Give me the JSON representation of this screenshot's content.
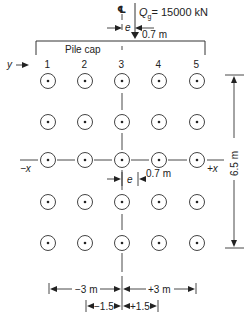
{
  "diagram": {
    "type": "pile-group-plan",
    "centerline_symbol": "℄",
    "load": {
      "label_prefix": "Q",
      "label_subscript": "g",
      "label_value": "= 15000 kN",
      "eccentricity_symbol": "e",
      "eccentricity_value": "0.7 m"
    },
    "pile_cap_label": "Pile cap",
    "y_axis_label": "y",
    "column_labels": [
      "1",
      "2",
      "3",
      "4",
      "5"
    ],
    "rows": 5,
    "columns": 5,
    "axis_labels": {
      "minus_x": "−x",
      "plus_x": "+x"
    },
    "mid_eccentricity": {
      "symbol": "e",
      "value": "0.7 m"
    },
    "vertical_dimension": "6.5 m",
    "bottom_dimensions": {
      "outer_left": "−3 m",
      "outer_right": "+3 m",
      "inner_left": "−1.5",
      "inner_right": "+1.5"
    },
    "colors": {
      "line": "#333333",
      "background": "#ffffff"
    }
  }
}
